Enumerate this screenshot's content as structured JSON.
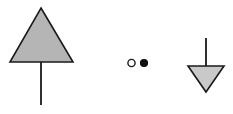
{
  "canvas": {
    "width": 233,
    "height": 114,
    "background": "#ffffff"
  },
  "style": {
    "stroke_color": "#1a1a1a",
    "triangle_fill_large": "#b5b5b5",
    "triangle_fill_small": "#c9c9c9",
    "dot_fill": "#111111",
    "circle_fill": "#ffffff",
    "shape_stroke_width": 1.6,
    "stem_stroke_width": 1.8,
    "marker_stroke_width": 1.4
  },
  "shapes": [
    {
      "id": "up-triangle-with-stem",
      "name": "filled-up-triangle-symbol",
      "type": "triangle",
      "direction": "up",
      "fill": "#b5b5b5",
      "stroke": "#1a1a1a",
      "apex_x": 41,
      "apex_y": 8,
      "base_y": 62,
      "base_left_x": 10,
      "base_right_x": 73,
      "points": "41,8 73,62 10,62",
      "stem": {
        "name": "down-stem",
        "x": 41,
        "y_start": 62,
        "y_end": 105,
        "direction": "down"
      }
    },
    {
      "id": "open-circle",
      "name": "open-circle-marker",
      "type": "circle",
      "fill": "#ffffff",
      "stroke": "#1a1a1a",
      "cx": 131.5,
      "cy": 63,
      "r": 3.6
    },
    {
      "id": "filled-dot",
      "name": "filled-dot-marker",
      "type": "circle",
      "fill": "#111111",
      "stroke": "#111111",
      "cx": 144,
      "cy": 63,
      "r": 3.4
    },
    {
      "id": "down-triangle-with-stem",
      "name": "filled-down-triangle-symbol",
      "type": "triangle",
      "direction": "down",
      "fill": "#c9c9c9",
      "stroke": "#1a1a1a",
      "apex_x": 206,
      "apex_y": 92,
      "base_y": 66,
      "base_left_x": 188,
      "base_right_x": 224,
      "points": "188,66 224,66 206,92",
      "stem": {
        "name": "up-stem",
        "x": 206,
        "y_start": 66,
        "y_end": 38,
        "direction": "up"
      }
    }
  ]
}
